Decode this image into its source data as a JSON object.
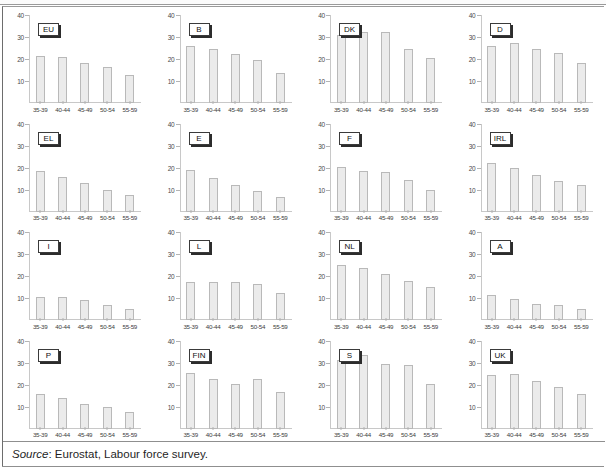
{
  "figure": {
    "source_prefix": "Source",
    "source_text": ": Eurostat, Labour force survey.",
    "bar_color": "#ebebeb",
    "bar_border_color": "#b9b9b9",
    "axis_color": "#c8c8c8",
    "frame_color": "#8f8f8f"
  },
  "chart_data": {
    "type": "bar",
    "title": "",
    "xlabel": "",
    "ylabel": "",
    "ylim": [
      0,
      40
    ],
    "yticks": [
      10,
      20,
      30,
      40
    ],
    "grid": false,
    "legend": "none",
    "categories": [
      "35-39",
      "40-44",
      "45-49",
      "50-54",
      "55-59"
    ],
    "panels": [
      {
        "label": "EU",
        "values": [
          21.2,
          20.7,
          18.4,
          16.2,
          12.6
        ]
      },
      {
        "label": "B",
        "values": [
          26.1,
          24.7,
          22.1,
          19.7,
          13.5
        ]
      },
      {
        "label": "DK",
        "values": [
          31.0,
          32.5,
          32.1,
          24.5,
          20.6
        ]
      },
      {
        "label": "D",
        "values": [
          26.0,
          27.1,
          24.5,
          22.8,
          18.3
        ]
      },
      {
        "label": "EL",
        "values": [
          18.3,
          15.7,
          12.8,
          9.9,
          7.5
        ]
      },
      {
        "label": "E",
        "values": [
          18.8,
          15.2,
          12.0,
          9.2,
          6.8
        ]
      },
      {
        "label": "F",
        "values": [
          20.4,
          18.3,
          17.9,
          14.2,
          9.8
        ]
      },
      {
        "label": "IRL",
        "values": [
          22.0,
          19.7,
          16.8,
          13.9,
          12.0
        ]
      },
      {
        "label": "I",
        "values": [
          10.6,
          10.6,
          9.0,
          6.8,
          4.8
        ]
      },
      {
        "label": "L",
        "values": [
          17.2,
          17.3,
          17.4,
          16.5,
          12.1
        ]
      },
      {
        "label": "NL",
        "values": [
          25.2,
          23.7,
          21.0,
          17.9,
          15.2
        ]
      },
      {
        "label": "A",
        "values": [
          11.3,
          9.6,
          7.3,
          6.8,
          4.8
        ]
      },
      {
        "label": "P",
        "values": [
          15.8,
          13.7,
          11.1,
          9.8,
          7.3
        ]
      },
      {
        "label": "FIN",
        "values": [
          25.4,
          22.3,
          20.2,
          22.4,
          16.6
        ]
      },
      {
        "label": "S",
        "values": [
          31.0,
          33.6,
          29.5,
          28.8,
          20.4
        ]
      },
      {
        "label": "UK",
        "values": [
          24.2,
          24.7,
          21.7,
          19.0,
          15.8
        ]
      }
    ]
  }
}
